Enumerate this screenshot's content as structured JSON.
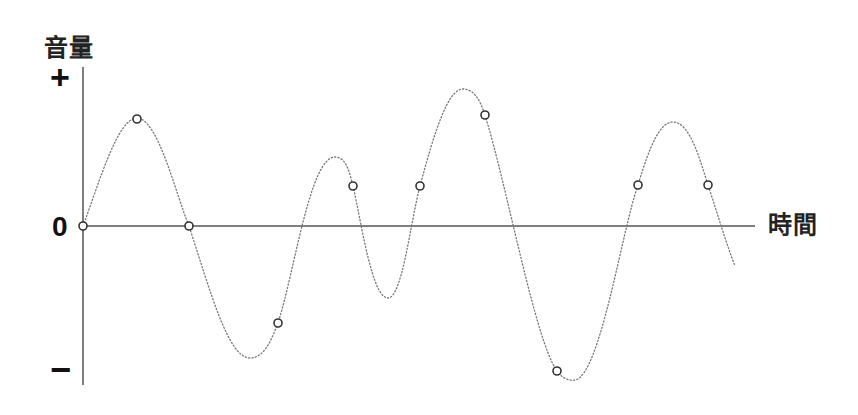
{
  "diagram": {
    "type": "sampled-waveform",
    "y_axis": {
      "title": "音量",
      "ticks": {
        "plus": "+",
        "zero": "0",
        "minus": "−"
      }
    },
    "x_axis": {
      "title": "時間"
    },
    "colors": {
      "axis": "#555555",
      "curve": "#777777",
      "point_stroke": "#333333",
      "point_fill": "#ffffff",
      "text": "#222222"
    },
    "axis_geometry": {
      "origin": [
        83,
        226
      ],
      "y_axis_top": 67,
      "y_axis_bottom": 385,
      "x_axis_right": 755
    },
    "curve_path": "M83,226 C100,180 118,118 137,118 C158,118 176,195 189,226 C210,290 228,358 250,358 C265,358 272,338 278,323 C295,270 310,157 335,157 C347,157 350,175 353,186 C362,225 372,298 388,298 C402,298 410,225 420,186 C435,130 448,89 463,89 C474,89 480,100 485,115 C508,190 535,340 557,371 C562,378 568,381 575,380 C600,376 622,230 638,185 C650,145 660,122 673,122 C690,122 700,160 708,185 C718,215 725,240 735,266",
    "sample_points": [
      {
        "x": 83,
        "y": 226
      },
      {
        "x": 137,
        "y": 119
      },
      {
        "x": 189,
        "y": 226
      },
      {
        "x": 278,
        "y": 323
      },
      {
        "x": 353,
        "y": 186
      },
      {
        "x": 420,
        "y": 186
      },
      {
        "x": 485,
        "y": 115
      },
      {
        "x": 557,
        "y": 371
      },
      {
        "x": 638,
        "y": 185
      },
      {
        "x": 708,
        "y": 185
      }
    ]
  }
}
